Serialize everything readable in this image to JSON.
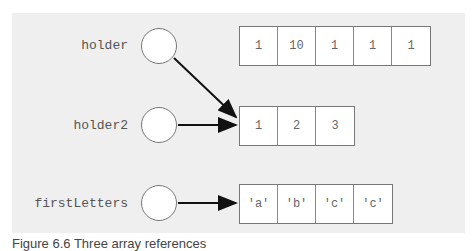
{
  "variables": [
    {
      "name": "holder",
      "points_to": "array_0"
    },
    {
      "name": "holder2",
      "points_to": "array_1"
    },
    {
      "name": "firstLetters",
      "points_to": "array_2"
    }
  ],
  "arrays": [
    {
      "id": "array_0",
      "values": [
        "1",
        "10",
        "1",
        "1",
        "1"
      ]
    },
    {
      "id": "array_1",
      "values": [
        "1",
        "2",
        "3"
      ]
    },
    {
      "id": "array_2",
      "values": [
        "'a'",
        "'b'",
        "'c'",
        "'c'"
      ]
    }
  ],
  "caption": "Figure 6.6  Three array references"
}
